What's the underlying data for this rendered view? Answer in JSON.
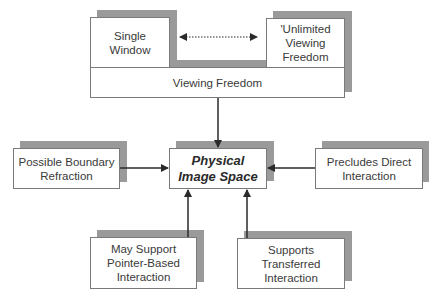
{
  "diagram": {
    "top_left": {
      "label": "Single\nWindow"
    },
    "top_right": {
      "label": "'Unlimited\nViewing\nFreedom"
    },
    "bar": {
      "label": "Viewing Freedom"
    },
    "center": {
      "label": "Physical\nImage Space"
    },
    "left": {
      "label": "Possible Boundary\nRefraction"
    },
    "right": {
      "label": "Precludes Direct\nInteraction"
    },
    "bottom_left": {
      "label": "May Support\nPointer-Based\nInteraction"
    },
    "bottom_right": {
      "label": "Supports\nTransferred\nInteraction"
    }
  },
  "colors": {
    "shadow": "#9a9a9a",
    "border": "#7a7a7a",
    "arrow": "#2a2a2a"
  }
}
